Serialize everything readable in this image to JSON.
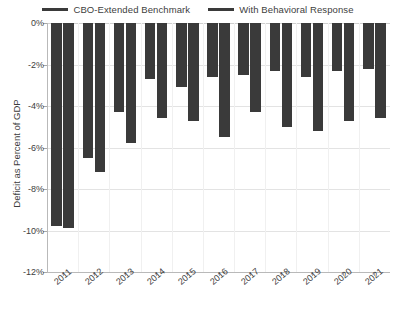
{
  "chart_data": {
    "type": "bar",
    "title": "",
    "xlabel": "",
    "ylabel": "Deficit as Percent of GDP",
    "categories": [
      "2011",
      "2012",
      "2013",
      "2014",
      "2015",
      "2016",
      "2017",
      "2018",
      "2019",
      "2020",
      "2021"
    ],
    "series": [
      {
        "name": "CBO-Extended Benchmark",
        "color": "#3a3a3a",
        "values": [
          -9.8,
          -6.5,
          -4.3,
          -2.7,
          -3.1,
          -2.6,
          -2.5,
          -2.3,
          -2.6,
          -2.3,
          -2.2
        ]
      },
      {
        "name": "With Behavioral Response",
        "color": "#3a3a3a",
        "values": [
          -9.9,
          -7.2,
          -5.8,
          -4.6,
          -4.7,
          -5.5,
          -4.3,
          -5.0,
          -5.2,
          -4.7,
          -4.6
        ]
      }
    ],
    "ylim": [
      -12,
      0
    ],
    "yticks": [
      0,
      -2,
      -4,
      -6,
      -8,
      -10,
      -12
    ],
    "ytick_labels": [
      "0%",
      "-2%",
      "-4%",
      "-6%",
      "-8%",
      "-10%",
      "-12%"
    ],
    "grid": true,
    "grid_axis": "y",
    "legend_position": "top-center",
    "legend": [
      {
        "label": "CBO-Extended Benchmark",
        "color": "#3a3a3a"
      },
      {
        "label": "With Behavioral Response",
        "color": "#3a3a3a"
      }
    ]
  },
  "colors": {
    "bar": "#3a3a3a",
    "grid": "#e3e3e3",
    "axis": "#b9b9b9",
    "text": "#3d3d3d",
    "background": "#ffffff"
  }
}
